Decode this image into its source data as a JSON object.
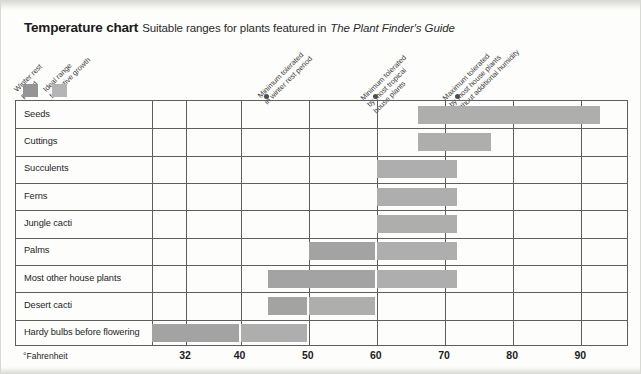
{
  "title": {
    "main": "Temperature chart",
    "sub_before": "Suitable ranges for plants featured in",
    "sub_italic": "The Plant Finder's Guide"
  },
  "legend": {
    "items": [
      {
        "label_line1": "Winter rest",
        "label_line2": "period",
        "color": "#949494"
      },
      {
        "label_line1": "Ideal range",
        "label_line2": "for active growth",
        "color": "#b4b4b4"
      }
    ]
  },
  "annotations": [
    {
      "line1": "Minimum tolerated",
      "line2": "in winter rest period",
      "value": 44
    },
    {
      "line1": "Minimum tolerated",
      "line2": "by most tropical",
      "line3": "house plants",
      "value": 60
    },
    {
      "line1": "Maximum tolerated",
      "line2": "by most house plants",
      "line3": "without additional humidity",
      "value": 72
    }
  ],
  "axis": {
    "unit_label": "°Fahrenheit",
    "ticks": [
      32,
      40,
      50,
      60,
      70,
      80,
      90
    ],
    "min": 27,
    "max": 97
  },
  "chart_data": {
    "type": "bar",
    "title": "Temperature chart",
    "subtitle": "Suitable ranges for plants featured in The Plant Finder's Guide",
    "xlabel": "°Fahrenheit",
    "ylabel": "",
    "xlim": [
      27,
      97
    ],
    "grid": true,
    "orientation": "horizontal",
    "legend": [
      "Winter rest period",
      "Ideal range for active growth"
    ],
    "categories": [
      "Seeds",
      "Cuttings",
      "Succulents",
      "Ferns",
      "Jungle cacti",
      "Palms",
      "Most other house plants",
      "Desert cacti",
      "Hardy bulbs before flowering"
    ],
    "ranges": [
      {
        "category": "Seeds",
        "rest": null,
        "ideal": [
          66,
          93
        ]
      },
      {
        "category": "Cuttings",
        "rest": null,
        "ideal": [
          66,
          77
        ]
      },
      {
        "category": "Succulents",
        "rest": null,
        "ideal": [
          60,
          72
        ]
      },
      {
        "category": "Ferns",
        "rest": null,
        "ideal": [
          60,
          72
        ]
      },
      {
        "category": "Jungle cacti",
        "rest": null,
        "ideal": [
          60,
          72
        ]
      },
      {
        "category": "Palms",
        "rest": [
          50,
          60
        ],
        "ideal": [
          60,
          72
        ]
      },
      {
        "category": "Most other house plants",
        "rest": [
          44,
          60
        ],
        "ideal": [
          60,
          72
        ]
      },
      {
        "category": "Desert cacti",
        "rest": [
          44,
          50
        ],
        "ideal": [
          50,
          60
        ]
      },
      {
        "category": "Hardy bulbs before flowering",
        "rest": [
          27,
          40
        ],
        "ideal": [
          40,
          50
        ]
      }
    ],
    "annotation_markers": [
      {
        "label": "Minimum tolerated in winter rest period",
        "value": 44
      },
      {
        "label": "Minimum tolerated by most tropical house plants",
        "value": 60
      },
      {
        "label": "Maximum tolerated by most house plants without additional humidity",
        "value": 72
      }
    ]
  }
}
